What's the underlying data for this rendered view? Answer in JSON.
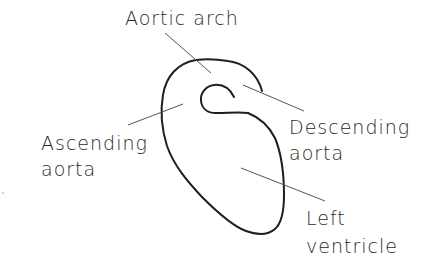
{
  "diagram": {
    "labels": {
      "aortic_arch": "Aortic arch",
      "ascending_line1": "Ascending",
      "ascending_line2": "aorta",
      "descending_line1": "Descending",
      "descending_line2": "aorta",
      "left_ventricle_line1": "Left",
      "left_ventricle_line2": "ventricle"
    },
    "colors": {
      "outline": "#1e1e1e",
      "leader": "#555555",
      "text": "#2a2a2a",
      "background": "#ffffff"
    }
  }
}
